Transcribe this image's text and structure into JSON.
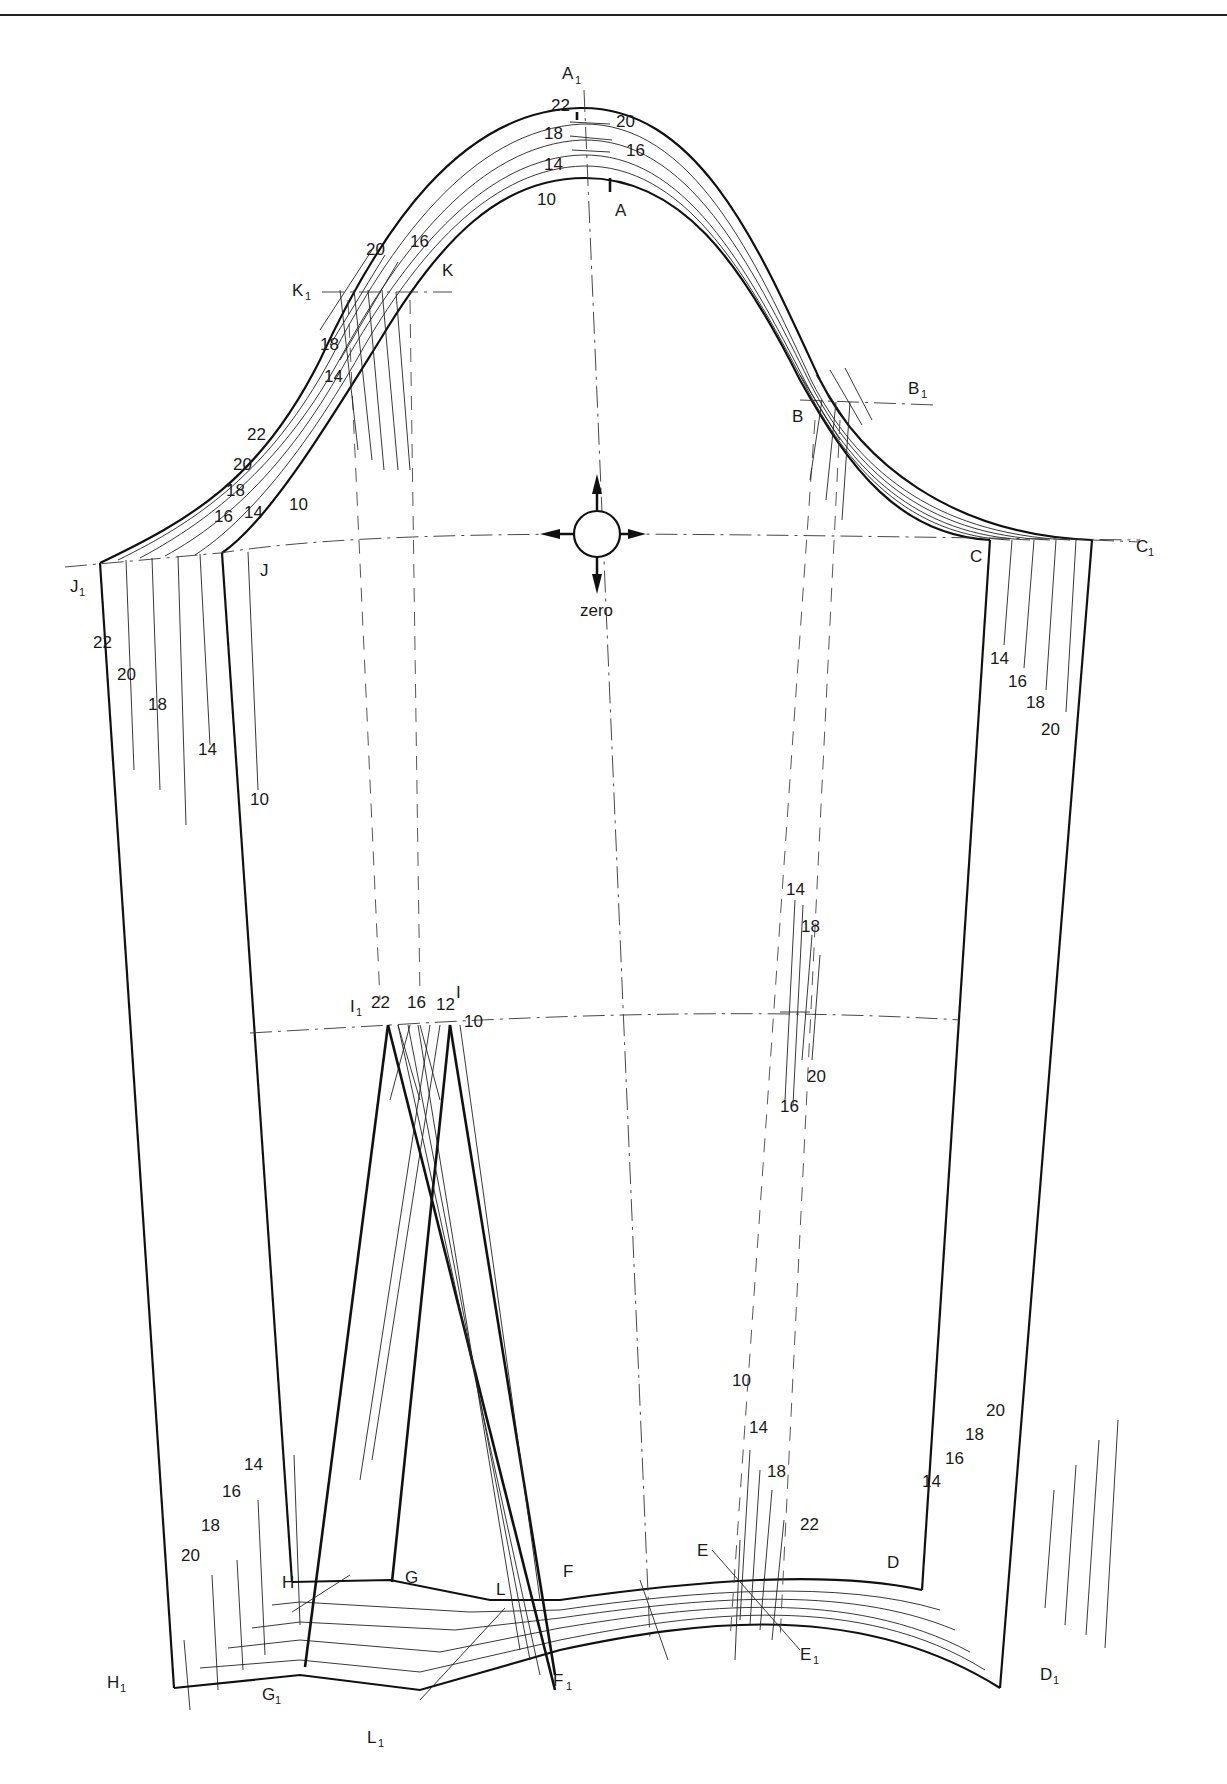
{
  "figure": {
    "zero_marker": {
      "label": "zero",
      "icon": "four-arrow-crosshair-icon"
    },
    "points": {
      "A": "A",
      "A1": "A",
      "B": "B",
      "B1": "B",
      "C": "C",
      "C1": "C",
      "D": "D",
      "D1": "D",
      "E": "E",
      "E1": "E",
      "F": "F",
      "F1": "F",
      "G": "G",
      "G1": "G",
      "H": "H",
      "H1": "H",
      "I": "I",
      "I1": "I",
      "J": "J",
      "J1": "J",
      "K": "K",
      "K1": "K",
      "L": "L",
      "L1": "L",
      "sub1": "1"
    },
    "grade_labels": {
      "crown": [
        "22",
        "20",
        "18",
        "16",
        "14",
        "10"
      ],
      "front_pitch": [
        "20",
        "16",
        "18",
        "14"
      ],
      "front_cap": [
        "22",
        "20",
        "18",
        "16",
        "14",
        "10"
      ],
      "left_seam": [
        "22",
        "20",
        "18",
        "14",
        "10"
      ],
      "right_seam": [
        "14",
        "16",
        "18",
        "20"
      ],
      "dart_top": [
        "22",
        "16",
        "12",
        "10"
      ],
      "elbow_right": [
        "14",
        "18",
        "20",
        "16"
      ],
      "hem_left": [
        "14",
        "16",
        "18",
        "20"
      ],
      "hem_mid": [
        "10",
        "14",
        "18",
        "22"
      ],
      "hem_right": [
        "14",
        "16",
        "18",
        "20"
      ]
    }
  }
}
